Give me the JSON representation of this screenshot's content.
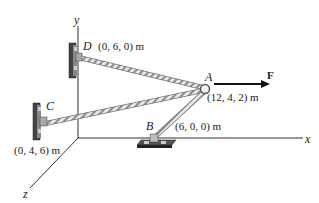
{
  "diagram": {
    "axes": {
      "x": "x",
      "y": "y",
      "z": "z"
    },
    "points": {
      "A": {
        "label": "A",
        "coords": "(12, 4, 2) m"
      },
      "B": {
        "label": "B",
        "coords": "(6, 0, 0) m"
      },
      "C": {
        "label": "C",
        "coords": "(0, 4, 6) m"
      },
      "D": {
        "label": "D",
        "coords": "(0, 6, 0) m"
      }
    },
    "force": {
      "label": "F",
      "direction": "+x"
    },
    "members": [
      {
        "name": "cable-AD",
        "from": "A",
        "to": "D",
        "type": "rope"
      },
      {
        "name": "cable-AC",
        "from": "A",
        "to": "C",
        "type": "rope"
      },
      {
        "name": "strut-AB",
        "from": "A",
        "to": "B",
        "type": "rope"
      }
    ],
    "colors": {
      "line": "#333333",
      "rope_light": "#e6e6e6",
      "rope_dark": "#8a8a8a",
      "bracket": "#555555"
    }
  }
}
